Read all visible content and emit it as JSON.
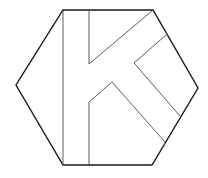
{
  "logo": {
    "name": "hexagon-k-logo",
    "letter": "K",
    "colors": {
      "background": "#ffffff",
      "outline": "#1a1a1a",
      "inner_line": "#4a4a4a"
    },
    "hexagon_points": "63,10 153,10 198,88 152,165 63,165 16,85",
    "k_lines": [
      {
        "name": "stem-left-line",
        "points": "63,10 63,165"
      },
      {
        "name": "stem-right-upper-line",
        "points": "89,10 89,64"
      },
      {
        "name": "upper-arm-top-line",
        "points": "89,64 153,10"
      },
      {
        "name": "stem-right-lower-line",
        "points": "89,165 89,102 112,82 165,142"
      },
      {
        "name": "notch-line",
        "points": "166,35 134,63 180,116"
      }
    ]
  }
}
